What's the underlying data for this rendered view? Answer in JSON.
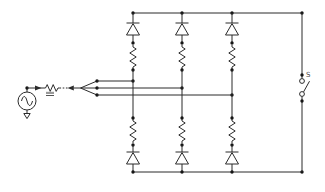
{
  "diagram": {
    "kind": "circuit-schematic",
    "branch_count": 3,
    "components": {
      "source": "ac-voltage-source",
      "source_ground": "ground",
      "series_element": "resistor",
      "series_mark": "impedance-mark",
      "fan_out": "three-wire-cable-fan",
      "top_branch_order": [
        "diode",
        "resistor"
      ],
      "bottom_branch_order": [
        "resistor",
        "diode"
      ],
      "diode_orientation": "cathode-up",
      "switch": "open-knife-switch"
    }
  },
  "labels": {
    "switch": "S"
  },
  "colors": {
    "background": "#ffffff",
    "line": "#2b2b2b",
    "dot": "#151515",
    "label": "#4a4a4a",
    "mark_fill": "#999999",
    "mark_edge": "#555555"
  }
}
